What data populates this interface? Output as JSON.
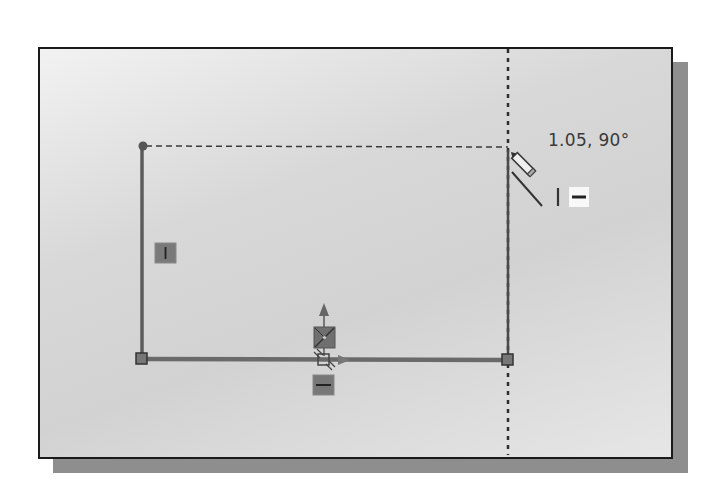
{
  "viewport": {
    "title": "Sketch viewport",
    "background_top": "#f2f2f2",
    "background_mid": "#d2d2d2",
    "shadow_color": "#8e8e8e",
    "border_color": "#1a1a1a"
  },
  "sketch": {
    "line_color": "#5a5a5a",
    "construction_color": "#333333",
    "cursor_readout": "1.05, 90°",
    "entities": [
      {
        "type": "line",
        "name": "left-vertical-line",
        "relation": "vertical"
      },
      {
        "type": "line",
        "name": "bottom-horizontal-line",
        "relation": "horizontal"
      },
      {
        "type": "line",
        "name": "right-vertical-line",
        "relation": "vertical (in progress)"
      }
    ],
    "relation_badges": [
      {
        "name": "vertical-relation-badge",
        "glyph": "|"
      },
      {
        "name": "horizontal-relation-badge",
        "glyph": "—"
      },
      {
        "name": "midpoint-relation-badge",
        "glyph": "⊠"
      }
    ],
    "cursor_inference": {
      "vertical_glyph": "I",
      "horizontal_glyph": "—"
    }
  }
}
